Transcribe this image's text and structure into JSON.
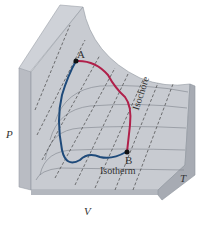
{
  "diagram": {
    "type": "PVT surface",
    "axes": {
      "p_label": "P",
      "v_label": "V",
      "t_label": "T"
    },
    "points": [
      {
        "label": "A"
      },
      {
        "label": "B"
      }
    ],
    "curve_labels": {
      "isochore": "Isochore",
      "isotherm": "Isotherm"
    },
    "colors": {
      "path_red": "#b0204a",
      "path_blue": "#1e4a7a",
      "surface": "#c9ccd2",
      "surface_light": "#dde0e5",
      "side": "#a7abb3"
    }
  }
}
